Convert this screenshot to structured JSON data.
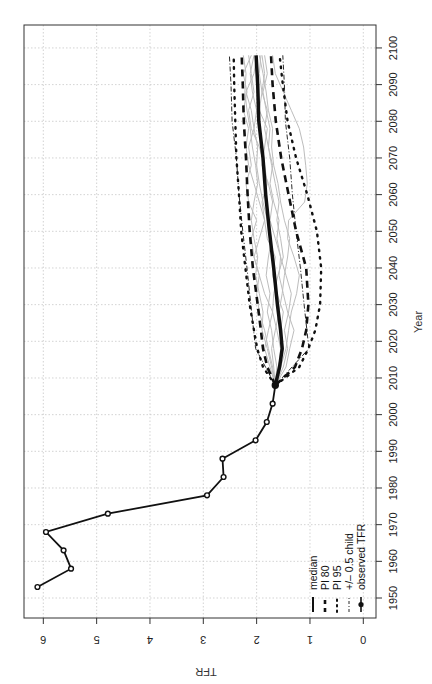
{
  "chart_data": {
    "type": "line",
    "orientation": "rotated-90-ccw",
    "title": "",
    "xlabel": "Year",
    "ylabel": "TFR",
    "xlim": [
      1945,
      2105
    ],
    "ylim": [
      0,
      6.3
    ],
    "x_ticks": [
      1950,
      1960,
      1970,
      1980,
      1990,
      2000,
      2010,
      2020,
      2030,
      2040,
      2050,
      2060,
      2070,
      2080,
      2090,
      2100
    ],
    "y_ticks": [
      0,
      1,
      2,
      3,
      4,
      5,
      6
    ],
    "grid": true,
    "legend_position": "bottom-left (rotated view)",
    "legend": [
      {
        "label": "median",
        "style": "solid-thick"
      },
      {
        "label": "PI 80",
        "style": "dashed-thick"
      },
      {
        "label": "PI 95",
        "style": "dotted"
      },
      {
        "label": "+/– 0.5 child",
        "style": "dash-dot"
      },
      {
        "label": "observed TFR",
        "style": "line-with-open-circles"
      }
    ],
    "series": [
      {
        "name": "observed TFR",
        "x": [
          1953,
          1958,
          1963,
          1968,
          1973,
          1978,
          1983,
          1988,
          1993,
          1998,
          2003,
          2008
        ],
        "values": [
          6.11,
          5.48,
          5.62,
          5.95,
          4.79,
          2.93,
          2.62,
          2.64,
          2.02,
          1.81,
          1.7,
          1.65
        ]
      },
      {
        "name": "median",
        "x": [
          2008,
          2013,
          2018,
          2023,
          2030,
          2040,
          2050,
          2060,
          2070,
          2080,
          2090,
          2098
        ],
        "values": [
          1.65,
          1.57,
          1.52,
          1.55,
          1.61,
          1.68,
          1.76,
          1.83,
          1.88,
          1.96,
          1.98,
          2.01
        ]
      },
      {
        "name": "PI 80 upper",
        "x": [
          2008,
          2013,
          2018,
          2023,
          2030,
          2040,
          2050,
          2060,
          2070,
          2080,
          2090,
          2098
        ],
        "values": [
          1.65,
          1.8,
          1.88,
          1.92,
          1.98,
          2.07,
          2.13,
          2.17,
          2.2,
          2.24,
          2.26,
          2.28
        ]
      },
      {
        "name": "PI 80 lower",
        "x": [
          2008,
          2013,
          2018,
          2023,
          2030,
          2040,
          2050,
          2060,
          2070,
          2080,
          2090,
          2098
        ],
        "values": [
          1.65,
          1.28,
          1.15,
          1.07,
          1.03,
          1.07,
          1.26,
          1.4,
          1.54,
          1.64,
          1.7,
          1.73
        ]
      },
      {
        "name": "PI 95 upper",
        "x": [
          2008,
          2013,
          2018,
          2023,
          2030,
          2040,
          2050,
          2060,
          2070,
          2080,
          2090,
          2098
        ],
        "values": [
          1.65,
          1.88,
          1.99,
          2.05,
          2.13,
          2.21,
          2.29,
          2.33,
          2.38,
          2.4,
          2.42,
          2.43
        ]
      },
      {
        "name": "PI 95 lower",
        "x": [
          2008,
          2013,
          2018,
          2023,
          2030,
          2040,
          2050,
          2060,
          2070,
          2080,
          2090,
          2098
        ],
        "values": [
          1.65,
          1.2,
          1.03,
          0.9,
          0.81,
          0.79,
          0.87,
          1.05,
          1.26,
          1.42,
          1.51,
          1.57
        ]
      },
      {
        "name": "+/- 0.5 child upper",
        "x": [
          2008,
          2018,
          2030,
          2040,
          2050,
          2060,
          2070,
          2080,
          2090,
          2098
        ],
        "values": [
          1.65,
          2.02,
          2.11,
          2.18,
          2.26,
          2.33,
          2.38,
          2.46,
          2.48,
          2.51
        ]
      },
      {
        "name": "+/- 0.5 child lower",
        "x": [
          2008,
          2018,
          2030,
          2040,
          2050,
          2060,
          2070,
          2080,
          2090,
          2098
        ],
        "values": [
          1.65,
          1.02,
          1.11,
          1.18,
          1.26,
          1.33,
          1.38,
          1.46,
          1.48,
          1.51
        ]
      }
    ],
    "trajectories": [
      {
        "x": [
          2008,
          2013,
          2018,
          2023,
          2028,
          2033,
          2038,
          2043,
          2048,
          2053,
          2058,
          2063,
          2068,
          2073,
          2078,
          2083,
          2088,
          2093,
          2098
        ],
        "values": [
          1.65,
          1.55,
          1.45,
          1.4,
          1.35,
          1.25,
          1.2,
          1.3,
          1.42,
          1.4,
          1.1,
          1.05,
          1.08,
          1.12,
          1.2,
          1.35,
          1.5,
          1.65,
          1.7
        ]
      },
      {
        "x": [
          2008,
          2013,
          2018,
          2023,
          2028,
          2033,
          2038,
          2043,
          2048,
          2053,
          2058,
          2063,
          2068,
          2073,
          2078,
          2083,
          2088,
          2093,
          2098
        ],
        "values": [
          1.65,
          1.7,
          1.78,
          1.85,
          1.95,
          2.0,
          1.95,
          2.05,
          2.1,
          2.0,
          2.15,
          2.2,
          2.1,
          2.15,
          2.05,
          2.1,
          2.2,
          2.05,
          2.0
        ]
      },
      {
        "x": [
          2008,
          2013,
          2018,
          2023,
          2028,
          2033,
          2038,
          2043,
          2048,
          2053,
          2058,
          2063,
          2068,
          2073,
          2078,
          2083,
          2088,
          2093,
          2098
        ],
        "values": [
          1.65,
          1.6,
          1.5,
          1.55,
          1.5,
          1.62,
          1.7,
          1.65,
          1.8,
          1.85,
          1.9,
          1.8,
          1.85,
          1.95,
          2.1,
          2.15,
          2.05,
          2.1,
          2.15
        ]
      },
      {
        "x": [
          2008,
          2013,
          2018,
          2023,
          2028,
          2033,
          2038,
          2043,
          2048,
          2053,
          2058,
          2063,
          2068,
          2073,
          2078,
          2083,
          2088,
          2093,
          2098
        ],
        "values": [
          1.65,
          1.45,
          1.38,
          1.3,
          1.42,
          1.5,
          1.58,
          1.55,
          1.65,
          1.75,
          1.7,
          1.78,
          1.9,
          1.85,
          1.8,
          1.95,
          1.9,
          1.85,
          1.9
        ]
      },
      {
        "x": [
          2008,
          2013,
          2018,
          2023,
          2028,
          2033,
          2038,
          2043,
          2048,
          2053,
          2058,
          2063,
          2068,
          2073,
          2078,
          2083,
          2088,
          2093,
          2098
        ],
        "values": [
          1.65,
          1.75,
          1.85,
          1.78,
          1.7,
          1.85,
          1.95,
          2.05,
          1.95,
          1.85,
          1.95,
          2.05,
          2.15,
          2.2,
          2.15,
          2.25,
          2.18,
          2.25,
          2.1
        ]
      },
      {
        "x": [
          2008,
          2013,
          2018,
          2023,
          2028,
          2033,
          2038,
          2043,
          2048,
          2053,
          2058,
          2063,
          2068,
          2073,
          2078,
          2083,
          2088,
          2093,
          2098
        ],
        "values": [
          1.65,
          1.5,
          1.42,
          1.48,
          1.4,
          1.35,
          1.45,
          1.55,
          1.62,
          1.58,
          1.68,
          1.75,
          1.7,
          1.78,
          1.85,
          1.8,
          1.9,
          1.95,
          1.92
        ]
      },
      {
        "x": [
          2008,
          2013,
          2018,
          2023,
          2028,
          2033,
          2038,
          2043,
          2048,
          2053,
          2058,
          2063,
          2068,
          2073,
          2078,
          2083,
          2088,
          2093,
          2098
        ],
        "values": [
          1.65,
          1.62,
          1.68,
          1.72,
          1.8,
          1.75,
          1.82,
          1.78,
          1.72,
          1.8,
          1.88,
          1.95,
          2.0,
          1.98,
          2.05,
          2.0,
          2.08,
          2.12,
          2.05
        ]
      },
      {
        "x": [
          2008,
          2013,
          2018,
          2023,
          2028,
          2033,
          2038,
          2043,
          2048,
          2053,
          2058,
          2063,
          2068,
          2073,
          2078,
          2083,
          2088,
          2093,
          2098
        ],
        "values": [
          1.65,
          1.58,
          1.55,
          1.62,
          1.7,
          1.68,
          1.6,
          1.5,
          1.55,
          1.62,
          1.58,
          1.65,
          1.72,
          1.78,
          1.75,
          1.82,
          1.88,
          1.8,
          1.85
        ]
      },
      {
        "x": [
          2008,
          2013,
          2018,
          2023,
          2028,
          2033,
          2038,
          2043,
          2048,
          2053,
          2058,
          2063,
          2068,
          2073,
          2078,
          2083,
          2088,
          2093,
          2098
        ],
        "values": [
          1.65,
          1.68,
          1.72,
          1.65,
          1.58,
          1.52,
          1.48,
          1.42,
          1.38,
          1.48,
          1.55,
          1.6,
          1.68,
          1.72,
          1.7,
          1.78,
          1.82,
          1.88,
          1.95
        ]
      },
      {
        "x": [
          2008,
          2013,
          2018,
          2023,
          2028,
          2033,
          2038,
          2043,
          2048,
          2053,
          2058,
          2063,
          2068,
          2073,
          2078,
          2083,
          2088,
          2093,
          2098
        ],
        "values": [
          1.65,
          1.72,
          1.8,
          1.9,
          1.88,
          1.95,
          2.02,
          1.98,
          2.05,
          2.1,
          2.05,
          1.98,
          2.02,
          2.08,
          2.12,
          2.18,
          2.22,
          2.2,
          2.25
        ]
      }
    ]
  },
  "axes": {
    "x_title": "Year",
    "y_title": "TFR",
    "x_tick_labels": [
      "1950",
      "1960",
      "1970",
      "1980",
      "1990",
      "2000",
      "2010",
      "2020",
      "2030",
      "2040",
      "2050",
      "2060",
      "2070",
      "2080",
      "2090",
      "2100"
    ],
    "y_tick_labels": [
      "0",
      "1",
      "2",
      "3",
      "4",
      "5",
      "6"
    ]
  },
  "legend": {
    "items": [
      "median",
      "PI 80",
      "PI 95",
      "+/– 0.5 child",
      "observed TFR"
    ]
  },
  "colors": {
    "line": "#111111",
    "trajectory": "#bdbdbd",
    "grid": "#c8c8c8",
    "axis": "#333333",
    "background": "#ffffff"
  }
}
